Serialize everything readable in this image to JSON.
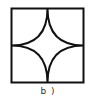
{
  "figure": {
    "caption": "b )",
    "shape": "square-with-four-concave-arcs",
    "stroke_color": "#111111",
    "background": "#ffffff"
  }
}
